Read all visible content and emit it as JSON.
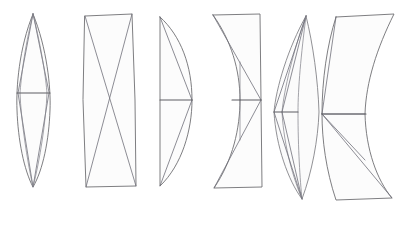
{
  "figure": {
    "background_color": "#ffffff",
    "stroke_color": "#6f6f73",
    "chord_color": "#5d5d62",
    "fill_color": "#fcfcfc",
    "canvas": {
      "width": 406,
      "height": 226
    },
    "shapes": [
      {
        "index": 1,
        "name": "narrow-vertical-lens",
        "label": "Narrow vertical lens with inscribed rhombus",
        "outline": "M 33 14 C 19 48 16 88 17 110 C 18 140 24 170 33 187 C 43 170 49 140 50 110 C 51 88 47 48 33 14 Z",
        "inner_paths": [
          "M 33 14 L 18 93 L 33 187 L 49 93 Z",
          "M 33 14 C 24 50 21 80 20 93 C 21 120 27 160 33 187",
          "M 33 14 C 42 50 46 80 47 93 C 46 120 40 160 33 187"
        ],
        "chord": {
          "x1": 17,
          "y1": 93,
          "x2": 50,
          "y2": 93
        }
      },
      {
        "index": 2,
        "name": "hourglass-bowtie",
        "label": "Hourglass with concave sides and X crossing",
        "outline": "M 85 16 L 132 14 L 135 100 L 136 186 L 86 187 L 83 100 Z",
        "inner_paths": [
          "M 85 16 L 136 186",
          "M 132 14 L 86 187"
        ],
        "chord": null
      },
      {
        "index": 3,
        "name": "half-lens-right-bulge",
        "label": "Half lens, straight left edge, right bulging arc",
        "outline": "M 160 17 L 160 100 L 160 186 C 182 165 192 130 192 100 C 192 66 181 36 160 17 Z",
        "inner_paths": [
          "M 160 17 L 192 100",
          "M 160 186 L 192 100"
        ],
        "chord": {
          "x1": 160,
          "y1": 100,
          "x2": 192,
          "y2": 100
        }
      },
      {
        "index": 4,
        "name": "concave-left-panel",
        "label": "Panel with straight right edge and concave left edge",
        "outline": "M 213 15 L 260 14 L 261 100 L 262 187 L 214 188 C 233 160 240 128 240 100 C 240 70 231 40 213 15 Z",
        "inner_paths": [
          "M 213 15 L 261 100",
          "M 214 188 L 261 100",
          "M 240 100 L 240 62",
          "M 240 100 L 240 140"
        ],
        "chord": {
          "x1": 232,
          "y1": 100,
          "x2": 261,
          "y2": 100
        }
      },
      {
        "index": 5,
        "name": "crescent-lune",
        "label": "Crescent lune with both arcs curving right",
        "outline": "M 306 16 C 288 48 276 88 274 112 C 276 146 288 180 302 199 C 312 172 318 140 319 112 C 318 80 313 44 306 16 Z",
        "inner_paths": [
          "M 306 16 C 293 52 284 90 282 112 C 284 148 294 180 302 199",
          "M 306 16 L 274 112 L 302 199",
          "M 306 16 L 282 112 L 302 199",
          "M 306 16 C 301 55 298 88 298 112 C 298 148 300 180 302 199"
        ],
        "chord": {
          "x1": 274,
          "y1": 112,
          "x2": 298,
          "y2": 112
        }
      },
      {
        "index": 6,
        "name": "curved-band-strip",
        "label": "Curved band with flat top and bottom and internal triangulation",
        "outline": "M 336 17 L 394 14 C 377 48 366 82 365 114 C 366 150 377 180 392 198 L 336 200 C 326 170 322 140 322 114 C 322 80 327 45 336 17 Z",
        "inner_paths": [
          "M 336 17 L 322 114",
          "M 392 198 L 322 114",
          "M 365 114 L 322 114",
          "M 322 114 L 365 160",
          "M 394 14 L 365 114"
        ],
        "chord": {
          "x1": 322,
          "y1": 114,
          "x2": 366,
          "y2": 114
        }
      }
    ]
  }
}
